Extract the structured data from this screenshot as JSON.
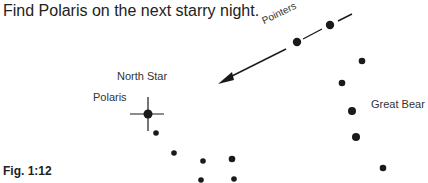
{
  "heading": "Find Polaris on the next starry night.",
  "labels": {
    "pointers": "Pointers",
    "north_star": "North Star",
    "polaris": "Polaris",
    "great_bear": "Great Bear"
  },
  "caption": "Fig. 1:12",
  "colors": {
    "ink": "#1a1a1a",
    "background": "#ffffff"
  }
}
